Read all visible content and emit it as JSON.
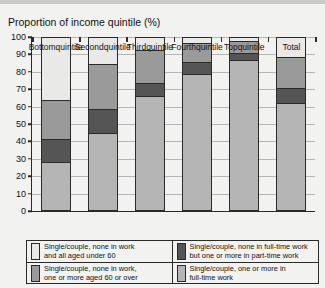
{
  "chart_data": {
    "type": "bar",
    "title": "Proportion of income quintile (%)",
    "xlabel": "",
    "ylabel": "",
    "ylim": [
      0,
      100
    ],
    "ytick_step": 10,
    "yticks": [
      0,
      10,
      20,
      30,
      40,
      50,
      60,
      70,
      80,
      90,
      100
    ],
    "grid": true,
    "stacked": true,
    "legend_position": "below",
    "categories": [
      "Bottom quintile",
      "Second quintile",
      "Third quintile",
      "Fourth quintile",
      "Top quintile",
      "Total"
    ],
    "series": [
      {
        "name": "Single/couple, one or more in full-time work",
        "color": "#b5b5b5",
        "values": [
          28,
          45,
          66,
          79,
          87,
          62
        ]
      },
      {
        "name": "Single/couple, none in full-time work but one or more in part-time work",
        "color": "#555555",
        "values": [
          13,
          14,
          8,
          7,
          4,
          9
        ]
      },
      {
        "name": "Single/couple, none in work, one or more aged 60 or over",
        "color": "#9a9a9a",
        "values": [
          23,
          26,
          19,
          11,
          7,
          18
        ]
      },
      {
        "name": "Single/couple, none in work and all aged under 60",
        "color": "#e9e9e7",
        "values": [
          36,
          15,
          7,
          3,
          2,
          11
        ]
      }
    ]
  },
  "legend": {
    "items": [
      {
        "swatch_name": "legend-swatch-none-in-work-under-60",
        "color": "#e9e9e7",
        "line1": "Single/couple, none in work",
        "line2": "and all aged under 60"
      },
      {
        "swatch_name": "legend-swatch-none-full-time-some-part-time",
        "color": "#555555",
        "line1": "Single/couple, none in full-time work",
        "line2": "but one or more in part-time work"
      },
      {
        "swatch_name": "legend-swatch-none-in-work-60-or-over",
        "color": "#9a9a9a",
        "line1": "Single/couple, none in work,",
        "line2": "one or more aged 60 or over"
      },
      {
        "swatch_name": "legend-swatch-one-or-more-full-time",
        "color": "#b5b5b5",
        "line1": "Single/couple, one or more in",
        "line2": "full-time work"
      }
    ]
  }
}
